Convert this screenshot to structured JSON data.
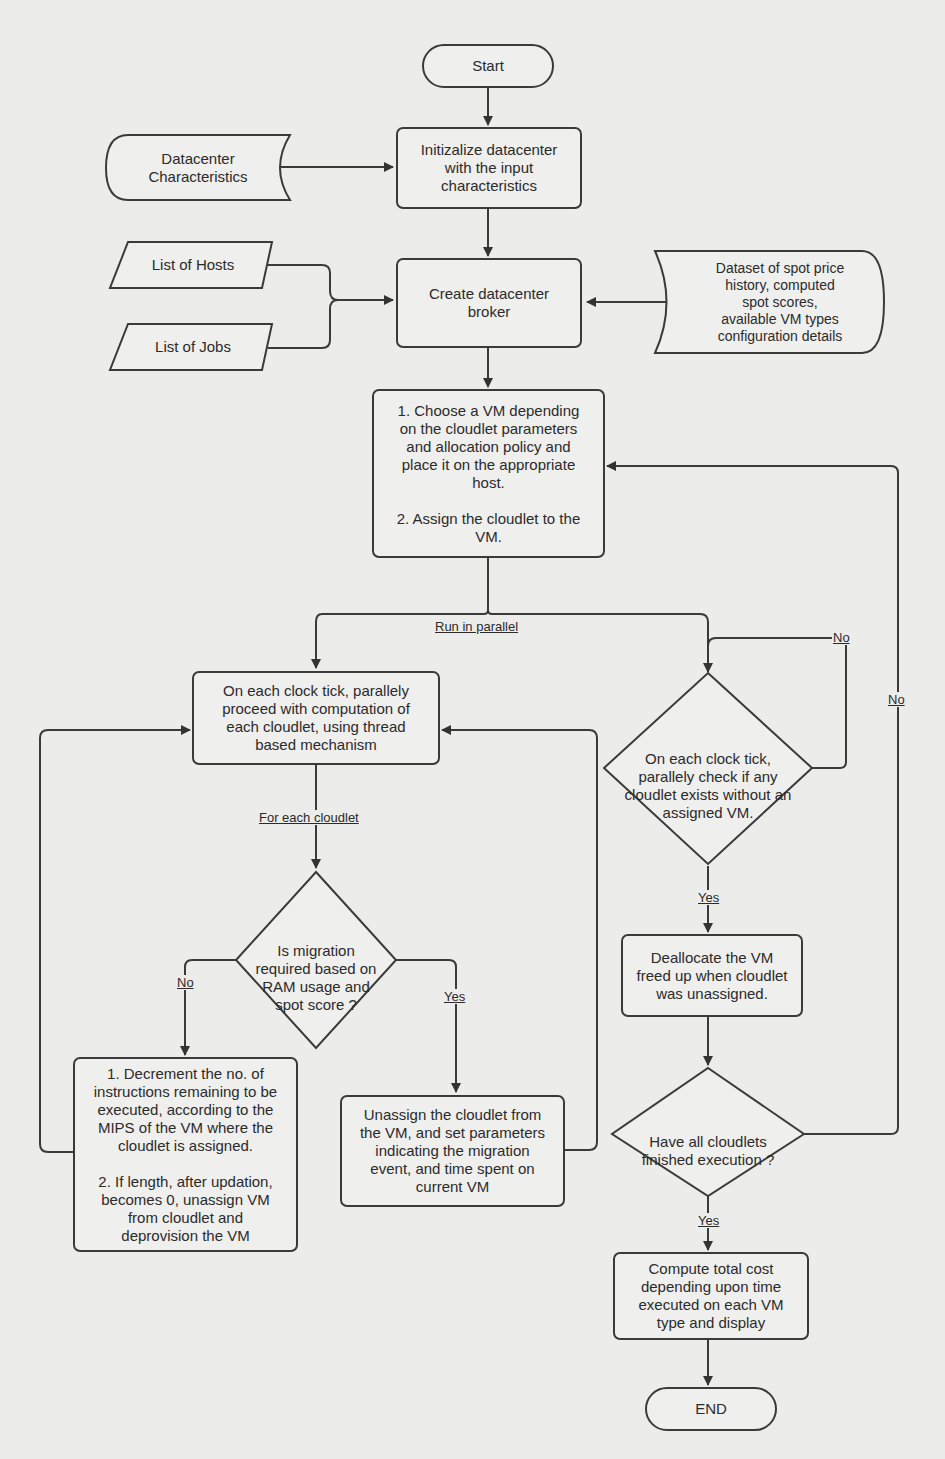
{
  "diagram": {
    "type": "flowchart",
    "nodes": {
      "start": "Start",
      "datacenter_characteristics": "Datacenter\nCharacteristics",
      "initialize": "Initizalize datacenter\nwith the input\ncharacteristics",
      "list_hosts": "List of Hosts",
      "list_jobs": "List of Jobs",
      "create_broker": "Create datacenter\nbroker",
      "dataset": "Dataset of spot price\nhistory, computed\nspot scores,\navailable VM types\nconfiguration details",
      "choose_vm": "1. Choose a VM depending\non the cloudlet parameters\nand allocation policy and\nplace it on the appropriate\nhost.\n\n2. Assign the cloudlet to the\nVM.",
      "compute_each": "On each clock tick, parallely\nproceed with computation of\neach cloudlet, using thread\nbased mechanism",
      "check_unassigned": "On each clock tick,\nparallely check if any\ncloudlet exists without an\nassigned VM.",
      "migration_decision": "Is migration\nrequired based on\nRAM usage and\nspot score ?",
      "decrement": "1. Decrement the no. of\ninstructions remaining to be\nexecuted, according to the\nMIPS of the VM where the\ncloudlet is assigned.\n\n2. If length, after updation,\nbecomes 0, unassign VM\nfrom cloudlet and\ndeprovision the VM",
      "unassign": "Unassign the cloudlet from\nthe VM, and set parameters\nindicating the migration\nevent, and time spent on\ncurrent VM",
      "deallocate": "Deallocate the VM\nfreed up when cloudlet\nwas unassigned.",
      "all_finished": "Have all cloudlets\nfinished execution ?",
      "compute_cost": "Compute total cost\ndepending upon time\nexecuted on each VM\ntype and display",
      "end": "END"
    },
    "edge_labels": {
      "run_parallel": "Run in parallel",
      "for_each_cloudlet": "For each cloudlet",
      "migration_no": "No",
      "migration_yes": "Yes",
      "check_no": "No",
      "check_yes": "Yes",
      "finished_no": "No",
      "finished_yes": "Yes"
    }
  }
}
